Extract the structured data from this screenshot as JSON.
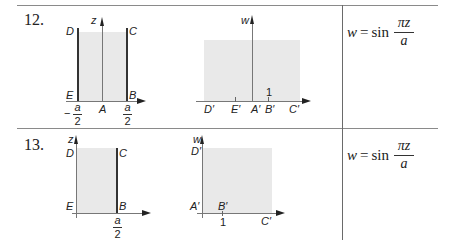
{
  "table": {
    "rows": [
      {
        "number": "12.",
        "z_plane": {
          "axis_labels": {
            "vertical": "z"
          },
          "points": {
            "D": "D",
            "C": "C",
            "E": "E",
            "B": "B",
            "A": "A"
          },
          "ticks": {
            "left": {
              "sign": "−",
              "num": "a",
              "den": "2"
            },
            "right": {
              "num": "a",
              "den": "2"
            }
          }
        },
        "w_plane": {
          "axis_labels": {
            "vertical": "w"
          },
          "points": {
            "D": "D′",
            "E": "E′",
            "A": "A′",
            "B": "B′",
            "C": "C′"
          },
          "tick_one": "1"
        },
        "formula": {
          "lhs": "w",
          "eq": "=",
          "fn": "sin",
          "num": "πz",
          "den": "a"
        }
      },
      {
        "number": "13.",
        "z_plane": {
          "axis_labels": {
            "vertical": "z"
          },
          "points": {
            "D": "D",
            "C": "C",
            "E": "E",
            "B": "B"
          },
          "ticks": {
            "right": {
              "num": "a",
              "den": "2"
            }
          }
        },
        "w_plane": {
          "axis_labels": {
            "vertical": "w"
          },
          "points": {
            "D": "D′",
            "A": "A′",
            "B": "B′",
            "C": "C′"
          },
          "tick_one": "1"
        },
        "formula": {
          "lhs": "w",
          "eq": "=",
          "fn": "sin",
          "num": "πz",
          "den": "a"
        }
      }
    ]
  }
}
